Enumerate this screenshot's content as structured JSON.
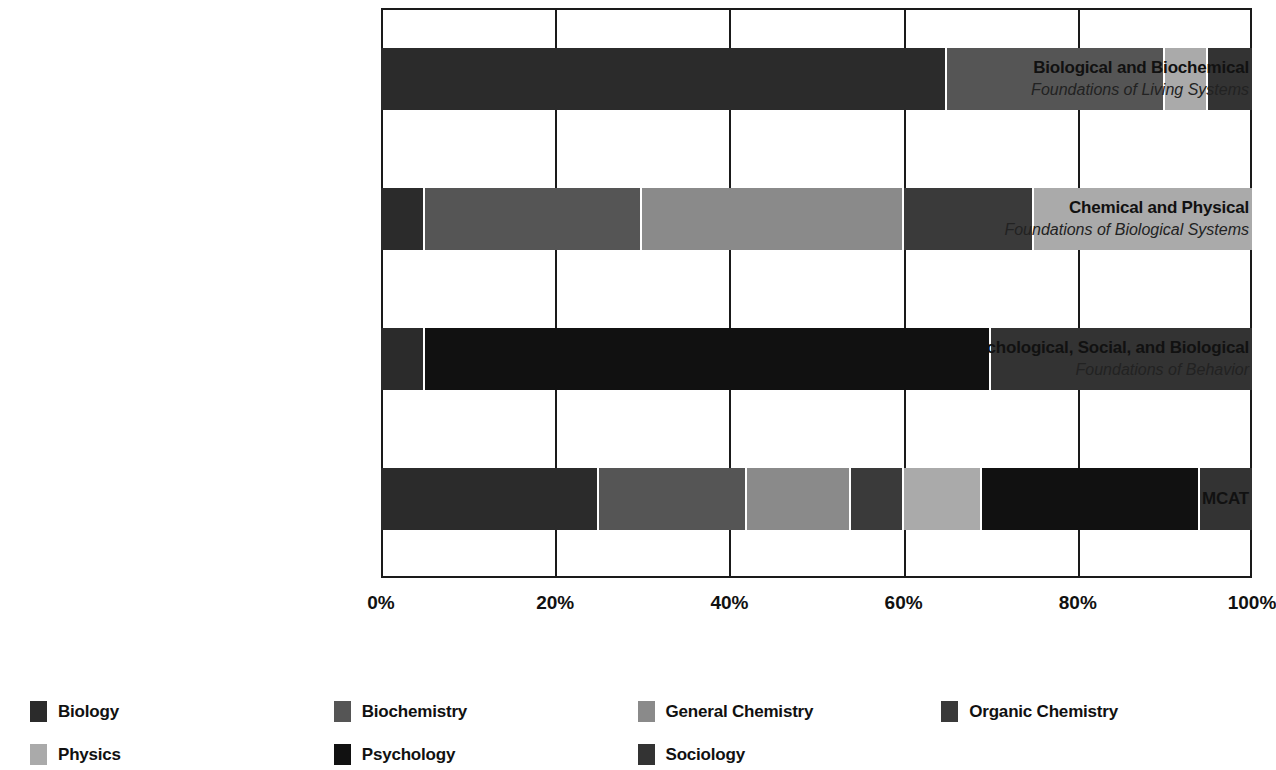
{
  "chart_data": {
    "type": "bar",
    "subtype": "stacked-horizontal-100pct",
    "title": "",
    "xlabel": "",
    "ylabel": "",
    "xlim": [
      0,
      100
    ],
    "x_ticks": [
      "0%",
      "20%",
      "40%",
      "60%",
      "80%",
      "100%"
    ],
    "x_tick_values": [
      0,
      20,
      40,
      60,
      80,
      100
    ],
    "grid": true,
    "legend_position": "bottom",
    "categories": [
      "Biological and Biochemical Foundations of Living Systems",
      "Chemical and Physical Foundations of Biological Systems",
      "Psychological, Social, and Biological Foundations of Behavior",
      "MCAT"
    ],
    "series": [
      {
        "name": "Biology",
        "color": "#2b2b2b",
        "values": [
          65,
          5,
          5,
          25
        ]
      },
      {
        "name": "Biochemistry",
        "color": "#555555",
        "values": [
          25,
          25,
          0,
          17
        ]
      },
      {
        "name": "General Chemistry",
        "color": "#8a8a8a",
        "values": [
          0,
          30,
          0,
          12
        ]
      },
      {
        "name": "Organic Chemistry",
        "color": "#3a3a3a",
        "values": [
          0,
          15,
          0,
          6
        ]
      },
      {
        "name": "Physics",
        "color": "#aaaaaa",
        "values": [
          5,
          25,
          0,
          9
        ]
      },
      {
        "name": "Psychology",
        "color": "#111111",
        "values": [
          0,
          0,
          65,
          25
        ]
      },
      {
        "name": "Sociology",
        "color": "#333333",
        "values": [
          5,
          0,
          30,
          6
        ]
      }
    ]
  },
  "axis": {
    "ticks": [
      {
        "label": "0%",
        "value": 0
      },
      {
        "label": "20%",
        "value": 20
      },
      {
        "label": "40%",
        "value": 40
      },
      {
        "label": "60%",
        "value": 60
      },
      {
        "label": "80%",
        "value": 80
      },
      {
        "label": "100%",
        "value": 100
      }
    ]
  },
  "bars": [
    {
      "title": "Biological and Biochemical",
      "subtitle": "Foundations of Living Systems",
      "segments": [
        {
          "name": "Biology",
          "value": 65,
          "color": "#2b2b2b"
        },
        {
          "name": "Biochemistry",
          "value": 25,
          "color": "#555555"
        },
        {
          "name": "Physics",
          "value": 5,
          "color": "#aaaaaa"
        },
        {
          "name": "Sociology",
          "value": 5,
          "color": "#333333"
        }
      ]
    },
    {
      "title": "Chemical and Physical",
      "subtitle": "Foundations of Biological Systems",
      "segments": [
        {
          "name": "Biology",
          "value": 5,
          "color": "#2b2b2b"
        },
        {
          "name": "Biochemistry",
          "value": 25,
          "color": "#555555"
        },
        {
          "name": "General Chemistry",
          "value": 30,
          "color": "#8a8a8a"
        },
        {
          "name": "Organic Chemistry",
          "value": 15,
          "color": "#3a3a3a"
        },
        {
          "name": "Physics",
          "value": 25,
          "color": "#aaaaaa"
        }
      ]
    },
    {
      "title": "Psychological, Social, and Biological",
      "subtitle": "Foundations of Behavior",
      "segments": [
        {
          "name": "Biology",
          "value": 5,
          "color": "#2b2b2b"
        },
        {
          "name": "Psychology",
          "value": 65,
          "color": "#111111"
        },
        {
          "name": "Sociology",
          "value": 30,
          "color": "#333333"
        }
      ]
    },
    {
      "title": "MCAT",
      "subtitle": "",
      "segments": [
        {
          "name": "Biology",
          "value": 25,
          "color": "#2b2b2b"
        },
        {
          "name": "Biochemistry",
          "value": 17,
          "color": "#555555"
        },
        {
          "name": "General Chemistry",
          "value": 12,
          "color": "#8a8a8a"
        },
        {
          "name": "Organic Chemistry",
          "value": 6,
          "color": "#3a3a3a"
        },
        {
          "name": "Physics",
          "value": 9,
          "color": "#aaaaaa"
        },
        {
          "name": "Psychology",
          "value": 25,
          "color": "#111111"
        },
        {
          "name": "Sociology",
          "value": 6,
          "color": "#333333"
        }
      ]
    }
  ],
  "legend": [
    {
      "label": "Biology",
      "color": "#2b2b2b"
    },
    {
      "label": "Biochemistry",
      "color": "#555555"
    },
    {
      "label": "General Chemistry",
      "color": "#8a8a8a"
    },
    {
      "label": "Organic Chemistry",
      "color": "#3a3a3a"
    },
    {
      "label": "Physics",
      "color": "#aaaaaa"
    },
    {
      "label": "Psychology",
      "color": "#111111"
    },
    {
      "label": "Sociology",
      "color": "#333333"
    }
  ]
}
